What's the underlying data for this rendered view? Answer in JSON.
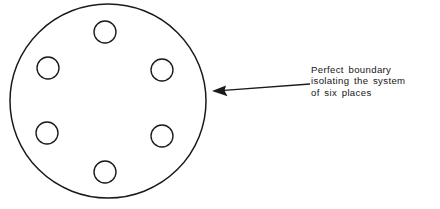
{
  "figure": {
    "title": "Perfect boundary isolating the system of six places",
    "background_color": "#ffffff",
    "ink_color": "#1a1a1a",
    "boundary": {
      "label": "perfect-boundary",
      "center_x": 108,
      "center_y": 101,
      "radius_x": 98,
      "radius_y": 97,
      "stroke_width": 1.5
    },
    "places": {
      "count": 6,
      "radius": 11,
      "items": [
        {
          "name": "place-top",
          "cx": 105,
          "cy": 32
        },
        {
          "name": "place-upper-left",
          "cx": 48,
          "cy": 68
        },
        {
          "name": "place-upper-right",
          "cx": 162,
          "cy": 70
        },
        {
          "name": "place-lower-left",
          "cx": 47,
          "cy": 133
        },
        {
          "name": "place-lower-right",
          "cx": 162,
          "cy": 136
        },
        {
          "name": "place-bottom",
          "cx": 105,
          "cy": 172
        }
      ]
    },
    "callout": {
      "arrow": {
        "tip_x": 212,
        "tip_y": 91,
        "tail_x": 310,
        "tail_y": 84,
        "head_length": 13,
        "head_half_width": 5
      },
      "text_lines": [
        "Perfect  boundary",
        "isolating  the  system",
        "of  six  places"
      ],
      "text_full": "Perfect boundary isolating the system of six places"
    }
  }
}
